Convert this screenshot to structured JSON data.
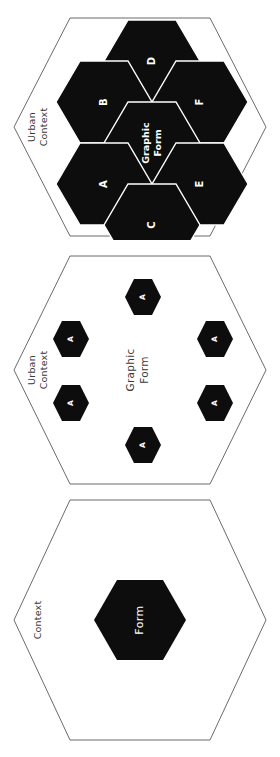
{
  "figure": {
    "orientation": "rotated-90-clockwise",
    "background_color": "#ffffff",
    "fill_color": "#0d0d0d",
    "outline_color": "#5a5a5a",
    "label_light_color": "#ffffff",
    "label_dark_color": "#3a3a3a"
  },
  "diagrams": [
    {
      "id": "diagram-aggregated-form",
      "context_label": "Urban\nContext",
      "context_line_1": "Urban",
      "context_line_2": "Context",
      "center_line_1": "Graphic",
      "center_line_2": "Form",
      "center_label": "Graphic Form",
      "cells": [
        {
          "label": "A",
          "position": "lower-left"
        },
        {
          "label": "B",
          "position": "upper-left"
        },
        {
          "label": "C",
          "position": "bottom"
        },
        {
          "label": "D",
          "position": "top"
        },
        {
          "label": "E",
          "position": "lower-right"
        },
        {
          "label": "F",
          "position": "upper-right"
        }
      ]
    },
    {
      "id": "diagram-dispersed-form",
      "context_label": "Urban\nContext",
      "context_line_1": "Urban",
      "context_line_2": "Context",
      "center_line_1": "Graphic",
      "center_line_2": "Form",
      "center_label": "Graphic Form",
      "cells": [
        {
          "label": "A",
          "position": "top"
        },
        {
          "label": "A",
          "position": "upper-left"
        },
        {
          "label": "A",
          "position": "upper-right"
        },
        {
          "label": "A",
          "position": "lower-left"
        },
        {
          "label": "A",
          "position": "lower-right"
        },
        {
          "label": "A",
          "position": "bottom"
        }
      ]
    },
    {
      "id": "diagram-single-form",
      "context_label": "Context",
      "context_line_1": "Context",
      "context_line_2": "",
      "center_label": "Form",
      "cells": []
    }
  ]
}
